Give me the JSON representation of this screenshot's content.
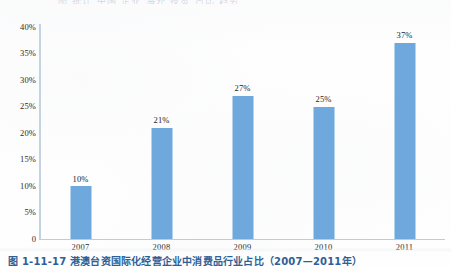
{
  "page": {
    "top_cut_text": "图  统计 中国 企业 海外 投资 占比 趋势",
    "caption": "图 1-11-17   港澳台资国际化经营企业中消费品行业占比（2007—2011年）",
    "caption_color": "#2f5f96"
  },
  "chart_data": {
    "type": "bar",
    "title": "",
    "subtitle": "",
    "xlabel": "",
    "ylabel": "",
    "categories": [
      "2007",
      "2008",
      "2009",
      "2010",
      "2011"
    ],
    "values": [
      10,
      21,
      27,
      25,
      37
    ],
    "value_labels": [
      "10%",
      "21%",
      "27%",
      "25%",
      "37%"
    ],
    "series": [
      {
        "name": "",
        "values": [
          10,
          21,
          27,
          25,
          37
        ],
        "color": "#6fa8dc"
      }
    ],
    "ylim": [
      0,
      40
    ],
    "ytick_values": [
      0,
      5,
      10,
      15,
      20,
      25,
      30,
      35,
      40
    ],
    "ytick_labels": [
      "0",
      "5%",
      "10%",
      "15%",
      "20%",
      "25%",
      "30%",
      "35%",
      "40%"
    ],
    "grid": false,
    "legend": false,
    "legend_position": "none",
    "bar_color": "#6fa8dc",
    "axis_color": "#c3d3e2",
    "background": "#ffffff",
    "annotations": []
  }
}
